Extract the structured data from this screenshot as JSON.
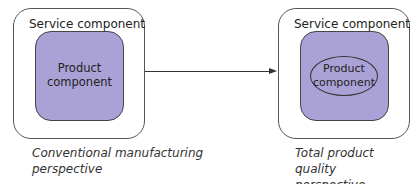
{
  "left_panel": {
    "outer_label": "Service component",
    "inner_label_line1": "Product",
    "inner_label_line2": "component",
    "perspective_line1": "Conventional manufacturing",
    "perspective_line2": "perspective"
  },
  "right_panel": {
    "outer_label": "Service component",
    "inner_label_line1": "Product",
    "inner_label_line2": "component",
    "perspective_line1": "Total product quality",
    "perspective_line2": "perspective"
  },
  "colors": {
    "product_fill": "#aaa2d6",
    "border": "#444444"
  }
}
